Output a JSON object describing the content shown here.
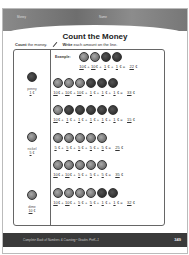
{
  "header": {
    "section_label": "Money",
    "section_label_right": "Name"
  },
  "title": "Count the Money",
  "instructions": {
    "count_bold": "Count",
    "count_rest": " the money.",
    "write_bold": "Write",
    "write_rest": " each amount on the line."
  },
  "reference": [
    {
      "name": "penny",
      "value": "1",
      "unit": "¢",
      "tone": "dark"
    },
    {
      "name": "nickel",
      "value": "5",
      "unit": "¢",
      "tone": "light"
    },
    {
      "name": "dime",
      "value": "10",
      "unit": "¢",
      "tone": "light"
    }
  ],
  "example_label": "Example:",
  "rows": [
    {
      "coins": [
        "light",
        "light",
        "dark",
        "dark"
      ],
      "addends": [
        "10",
        "10",
        "1",
        "1"
      ],
      "total": "22",
      "unit": "¢"
    },
    {
      "coins": [
        "light",
        "light",
        "light",
        "dark",
        "dark",
        "dark"
      ],
      "addends": [
        "10",
        "10",
        "10",
        "1",
        "1",
        "1"
      ],
      "total": "33",
      "unit": "¢"
    },
    {
      "coins": [
        "light",
        "dark",
        "dark",
        "dark",
        "dark",
        "dark"
      ],
      "addends": [
        "10",
        "1",
        "1",
        "1",
        "1",
        "1"
      ],
      "total": "15",
      "unit": "¢"
    },
    {
      "coins": [
        "light",
        "light",
        "light",
        "light",
        "light"
      ],
      "addends": [
        "5",
        "5",
        "5",
        "5",
        "5"
      ],
      "total": "25",
      "unit": "¢"
    },
    {
      "coins": [
        "light",
        "light",
        "light",
        "light",
        "light"
      ],
      "addends": [
        "10",
        "10",
        "5",
        "5",
        "5"
      ],
      "total": "35",
      "unit": "¢"
    },
    {
      "coins": [
        "light",
        "light",
        "light",
        "light",
        "dark",
        "dark"
      ],
      "addends": [
        "10",
        "10",
        "5",
        "5",
        "1",
        "1"
      ],
      "total": "32",
      "unit": "¢"
    }
  ],
  "footer": {
    "book_title": "Complete Book of Numbers & Counting • Grades PreK–1",
    "page_number": "349"
  }
}
